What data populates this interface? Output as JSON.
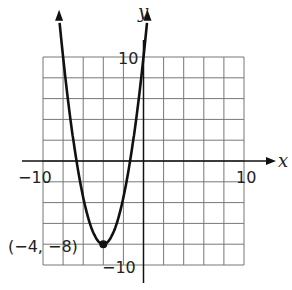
{
  "chart_data": {
    "type": "line",
    "title": "",
    "xlabel": "x",
    "ylabel": "y",
    "xlim": [
      -10,
      10
    ],
    "ylim": [
      -10,
      10
    ],
    "grid": true,
    "grid_step": 2,
    "tick_labels": {
      "x_min": "−10",
      "x_max": "10",
      "y_max": "10",
      "y_min": "−10"
    },
    "series": [
      {
        "name": "parabola",
        "function": "y = 1.125(x+4)^2 - 8",
        "x": [
          -8.3,
          -8,
          -7,
          -6,
          -5,
          -4,
          -3,
          -2,
          -1,
          0,
          0.3
        ],
        "y": [
          12.8,
          10,
          2.1,
          -3.5,
          -6.9,
          -8,
          -6.9,
          -3.5,
          2.1,
          10,
          12.8
        ]
      }
    ],
    "annotations": [
      {
        "text": "(−4, −8)",
        "x": -4,
        "y": -8,
        "marker": "point"
      }
    ]
  }
}
